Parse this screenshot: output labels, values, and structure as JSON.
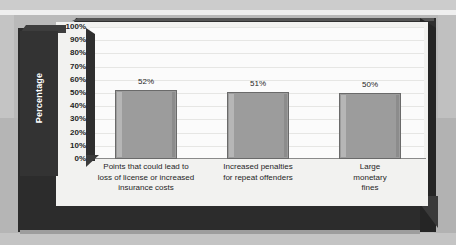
{
  "chart_data": {
    "type": "bar",
    "title": "",
    "subtitle": "",
    "xlabel": "",
    "ylabel": "Percentage",
    "ylim": [
      0,
      100
    ],
    "grid": true,
    "legend": "none",
    "categories": [
      "Points that could lead to loss of license or increased insurance costs",
      "Increased penalties for repeat offenders",
      "Large monetary fines"
    ],
    "category_lines": [
      [
        "Points that could lead to",
        "loss of license or increased",
        "insurance costs"
      ],
      [
        "Increased penalties",
        "for repeat offenders"
      ],
      [
        "Large",
        "monetary",
        "fines"
      ]
    ],
    "values": [
      52,
      51,
      50
    ],
    "value_labels": [
      "52%",
      "51%",
      "50%"
    ],
    "ytick_labels": [
      "100%",
      "90%",
      "80%",
      "70%",
      "60%",
      "50%",
      "40%",
      "30%",
      "20%",
      "10%",
      "0%"
    ],
    "ytick_values": [
      100,
      90,
      80,
      70,
      60,
      50,
      40,
      30,
      20,
      10,
      0
    ],
    "colors": {
      "bar_fill": "#9c9c9c",
      "bar_border": "#6a6a6a",
      "bar_highlight": "#b6b6b6",
      "bar_shadow": "#8c8c8c",
      "plot_background": "#fbfbfb",
      "panel_background": "#f2f2f0",
      "frame_dark": "#2c2c2c",
      "gridline": "#e6e6e4",
      "axis_line": "#8a8a8a",
      "ylabel_text": "#ffffff",
      "page_background": "#c4c4c4"
    }
  }
}
